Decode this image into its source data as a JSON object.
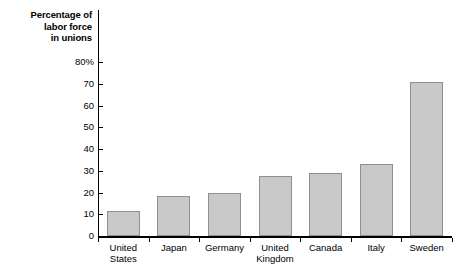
{
  "chart_data": {
    "type": "bar",
    "title": "",
    "ylabel": "Percentage of\nlabor force\nin unions",
    "ylabel_lines": [
      "Percentage of",
      "labor force",
      "in unions"
    ],
    "xlabel": "",
    "categories": [
      "United States",
      "Japan",
      "Germany",
      "United Kingdom",
      "Canada",
      "Italy",
      "Sweden"
    ],
    "category_lines": [
      [
        "United",
        "States"
      ],
      [
        "Japan"
      ],
      [
        "Germany"
      ],
      [
        "United",
        "Kingdom"
      ],
      [
        "Canada"
      ],
      [
        "Italy"
      ],
      [
        "Sweden"
      ]
    ],
    "values": [
      11.5,
      18.5,
      20,
      27.5,
      29,
      33,
      71
    ],
    "ylim": [
      0,
      80
    ],
    "yticks": [
      0,
      10,
      20,
      30,
      40,
      50,
      60,
      70,
      80
    ],
    "ytick_labels": [
      "0",
      "10",
      "20",
      "30",
      "40",
      "50",
      "60",
      "70",
      "80%"
    ],
    "grid": false,
    "legend": null,
    "bar_color": "#c9c9c9",
    "bar_border_color": "#8f8f8f",
    "axis_color": "#000000"
  }
}
